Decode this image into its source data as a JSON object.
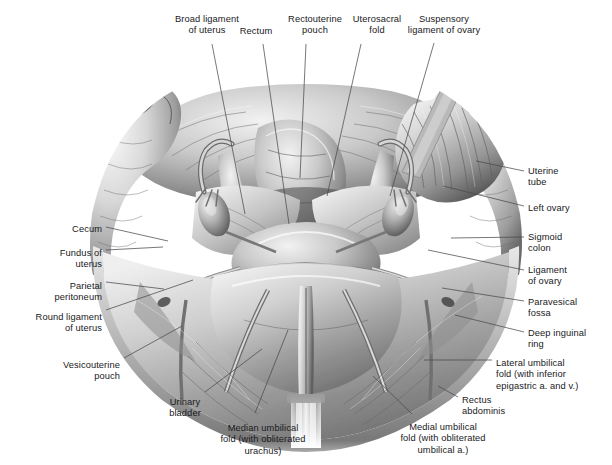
{
  "figure": {
    "type": "anatomical-illustration",
    "style": "grayscale-airbrush-medical-illustration",
    "background_color": "#ffffff",
    "label_text_color": "#19191c",
    "leader_line_color": "#4a4a52"
  },
  "labels": [
    {
      "id": "broad-ligament-of-uterus",
      "text": "Broad ligament\nof uterus",
      "align": "center",
      "x": 207,
      "y": 14
    },
    {
      "id": "rectum",
      "text": "Rectum",
      "align": "center",
      "x": 256,
      "y": 26
    },
    {
      "id": "rectouterine-pouch",
      "text": "Rectouterine\npouch",
      "align": "center",
      "x": 315,
      "y": 14
    },
    {
      "id": "uterosacral-fold",
      "text": "Uterosacral\nfold",
      "align": "center",
      "x": 377,
      "y": 14
    },
    {
      "id": "suspensory-ligament-of-ovary",
      "text": "Suspensory\nligament of ovary",
      "align": "center",
      "x": 444,
      "y": 14
    },
    {
      "id": "uterine-tube",
      "text": "Uterine\ntube",
      "align": "left",
      "x": 528,
      "y": 166
    },
    {
      "id": "left-ovary",
      "text": "Left ovary",
      "align": "left",
      "x": 528,
      "y": 203
    },
    {
      "id": "sigmoid-colon",
      "text": "Sigmoid\ncolon",
      "align": "left",
      "x": 528,
      "y": 232
    },
    {
      "id": "ligament-of-ovary",
      "text": "Ligament\nof ovary",
      "align": "left",
      "x": 528,
      "y": 265
    },
    {
      "id": "paravesical-fossa",
      "text": "Paravesical\nfossa",
      "align": "left",
      "x": 528,
      "y": 297
    },
    {
      "id": "deep-inguinal-ring",
      "text": "Deep inguinal\nring",
      "align": "left",
      "x": 528,
      "y": 328
    },
    {
      "id": "lateral-umbilical-fold",
      "text": "Lateral umbilical\nfold (with inferior\nepigastric a. and v.)",
      "align": "left",
      "x": 496,
      "y": 358
    },
    {
      "id": "rectus-abdominis",
      "text": "Rectus\nabdominis",
      "align": "left",
      "x": 462,
      "y": 395
    },
    {
      "id": "medial-umbilical-fold",
      "text": "Medial umbilical\nfold (with obliterated\numbilical a.)",
      "align": "center",
      "x": 443,
      "y": 422
    },
    {
      "id": "median-umbilical-fold",
      "text": "Median umbilical\nfold (with obliterated\nurachus)",
      "align": "center",
      "x": 263,
      "y": 423
    },
    {
      "id": "urinary-bladder",
      "text": "Urinary\nbladder",
      "align": "center",
      "x": 185,
      "y": 397
    },
    {
      "id": "vesicouterine-pouch",
      "text": "Vesicouterine\npouch",
      "align": "right",
      "x": 120,
      "y": 360
    },
    {
      "id": "round-ligament-of-uterus",
      "text": "Round ligament\nof uterus",
      "align": "right",
      "x": 102,
      "y": 312
    },
    {
      "id": "parietal-peritoneum",
      "text": "Parietal\nperitoneum",
      "align": "right",
      "x": 102,
      "y": 281
    },
    {
      "id": "fundus-of-uterus",
      "text": "Fundus of\nuterus",
      "align": "right",
      "x": 102,
      "y": 248
    },
    {
      "id": "cecum",
      "text": "Cecum",
      "align": "right",
      "x": 102,
      "y": 224
    }
  ],
  "leaders": [
    {
      "id": "leader-broad-ligament-of-uterus",
      "d": "M 212 44 L 245 214"
    },
    {
      "id": "leader-rectum",
      "d": "M 263 44 L 289 224"
    },
    {
      "id": "leader-rectouterine-pouch",
      "d": "M 306 44 L 300 178"
    },
    {
      "id": "leader-uterosacral-fold",
      "d": "M 361 44 L 327 196"
    },
    {
      "id": "leader-suspensory-ligament-of-ovary",
      "d": "M 434 43 L 390 196"
    },
    {
      "id": "leader-uterine-tube",
      "d": "M 524 171 L 476 161"
    },
    {
      "id": "leader-left-ovary",
      "d": "M 524 206 L 443 186"
    },
    {
      "id": "leader-sigmoid-colon",
      "d": "M 524 237 L 451 238"
    },
    {
      "id": "leader-ligament-of-ovary",
      "d": "M 524 270 L 428 250"
    },
    {
      "id": "leader-paravesical-fossa",
      "d": "M 524 301 L 442 288"
    },
    {
      "id": "leader-deep-inguinal-ring",
      "d": "M 524 332 L 455 315"
    },
    {
      "id": "leader-lateral-umbilical-fold",
      "d": "M 492 360 L 424 360"
    },
    {
      "id": "leader-rectus-abdominis",
      "d": "M 458 397 L 438 386"
    },
    {
      "id": "leader-medial-umbilical-fold",
      "d": "M 412 414 L 373 376"
    },
    {
      "id": "leader-median-umbilical-fold",
      "d": "M 255 413 L 288 330"
    },
    {
      "id": "leader-urinary-bladder",
      "d": "M 205 392 L 262 349"
    },
    {
      "id": "leader-vesicouterine-pouch",
      "d": "M 124 358 L 182 326"
    },
    {
      "id": "leader-round-ligament-of-uterus",
      "d": "M 106 310 L 193 280"
    },
    {
      "id": "leader-parietal-peritoneum",
      "d": "M 106 282 L 164 289"
    },
    {
      "id": "leader-fundus-of-uterus",
      "d": "M 106 250 L 163 247"
    },
    {
      "id": "leader-cecum",
      "d": "M 106 227 L 168 241"
    }
  ],
  "caption_partial": {
    "text": ""
  }
}
